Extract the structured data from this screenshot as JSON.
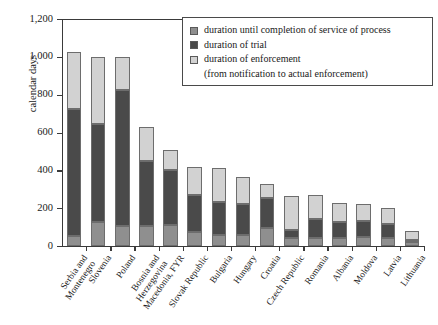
{
  "chart_data": {
    "type": "bar",
    "stacked": true,
    "title": "",
    "xlabel": "",
    "ylabel": "calendar days",
    "ylim": [
      0,
      1200
    ],
    "yticks": [
      0,
      200,
      400,
      600,
      800,
      1000,
      1200
    ],
    "ytick_labels": [
      "0",
      "200",
      "400",
      "600",
      "800",
      "1,000",
      "1,200"
    ],
    "grid": false,
    "legend_position": "top-right",
    "categories": [
      "Serbia and Montenegro",
      "Slovenia",
      "Poland",
      "Bosnia and Herzegovina",
      "Macedonia, FYR",
      "Slovak Republic",
      "Bulgaria",
      "Hungary",
      "Croatia",
      "Czech Republic",
      "Romania",
      "Albania",
      "Moldova",
      "Latvia",
      "Lithuania"
    ],
    "category_lines": [
      [
        "Serbia and",
        "Montenegro"
      ],
      [
        "Slovenia"
      ],
      [
        "Poland"
      ],
      [
        "Bosnia and",
        "Herzegovina"
      ],
      [
        "Macedonia, FYR"
      ],
      [
        "Slovak Republic"
      ],
      [
        "Bulgaria"
      ],
      [
        "Hungary"
      ],
      [
        "Croatia"
      ],
      [
        "Czech Republic"
      ],
      [
        "Romania"
      ],
      [
        "Albania"
      ],
      [
        "Moldova"
      ],
      [
        "Latvia"
      ],
      [
        "Lithuania"
      ]
    ],
    "series": [
      {
        "name": "duration until completion of service of process",
        "key": "service",
        "color": "#8f8f8f",
        "values": [
          55,
          125,
          105,
          105,
          110,
          75,
          60,
          60,
          95,
          40,
          45,
          45,
          50,
          40,
          20
        ]
      },
      {
        "name": "duration of trial",
        "key": "trial",
        "color": "#4a4a4a",
        "values": [
          670,
          520,
          720,
          345,
          290,
          195,
          175,
          160,
          160,
          45,
          100,
          80,
          80,
          75,
          10
        ]
      },
      {
        "name": "duration of enforcement (from notification to actual enforcement)",
        "key": "enforcement",
        "color": "#d2d2d2",
        "values": [
          300,
          355,
          175,
          180,
          110,
          150,
          175,
          145,
          75,
          180,
          125,
          100,
          90,
          85,
          50
        ]
      }
    ],
    "totals": [
      1025,
      1000,
      1000,
      630,
      510,
      420,
      410,
      365,
      330,
      265,
      270,
      225,
      220,
      200,
      80
    ]
  },
  "legend": {
    "items": [
      {
        "label": "duration until completion of service of process",
        "swatch": "service"
      },
      {
        "label": "duration of trial",
        "swatch": "trial"
      },
      {
        "label": "duration of enforcement",
        "swatch": "enforcement"
      }
    ],
    "sub_note": "(from notification to actual enforcement)"
  },
  "colors": {
    "service": "#8f8f8f",
    "trial": "#4a4a4a",
    "enforcement": "#d2d2d2",
    "axis": "#3a3a3a",
    "text": "#1a1a1a",
    "background": "#ffffff"
  }
}
